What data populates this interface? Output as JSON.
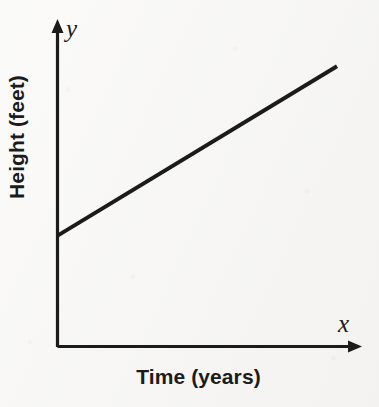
{
  "figure": {
    "background_color": "#f6f5f3",
    "ink_color": "#1b1b1b"
  },
  "axes": {
    "x_letter": "x",
    "y_letter": "y",
    "x_title": "Time (years)",
    "y_title": "Height (feet)"
  },
  "chart_data": {
    "type": "line",
    "title": "",
    "subtitle": "",
    "xlabel": "Time (years)",
    "ylabel": "Height (feet)",
    "x_axis_letter": "x",
    "y_axis_letter": "y",
    "grid": false,
    "legend": false,
    "legend_position": "none",
    "xlim": [
      0,
      1
    ],
    "ylim": [
      0,
      1
    ],
    "xticks": [],
    "yticks": [],
    "xticklabels": [],
    "yticklabels": [],
    "axis_arrows": {
      "x": "arrow at right end",
      "y": "arrow at top end"
    },
    "annotations": [],
    "series": [
      {
        "name": "height over time",
        "description": "straight line with positive slope and positive y-intercept",
        "x": [
          0.0,
          1.0
        ],
        "y": [
          0.35,
          0.88
        ],
        "slope": 0.53,
        "intercept": 0.35,
        "color": "#1b1b1b",
        "linewidth": 4
      }
    ]
  }
}
